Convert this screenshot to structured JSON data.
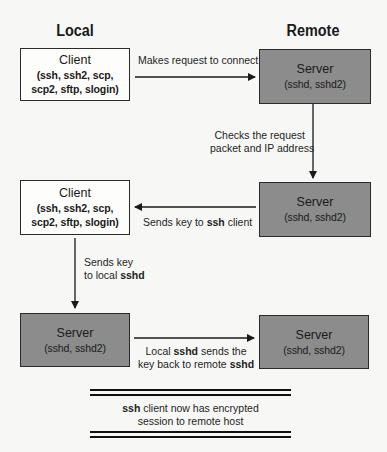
{
  "headings": {
    "local": "Local",
    "remote": "Remote"
  },
  "boxes": {
    "client_1": {
      "title": "Client",
      "line1": "(ssh, ssh2, scp,",
      "line2": "scp2, sftp, slogin)"
    },
    "server_1": {
      "title": "Server",
      "line1": "(sshd, sshd2)"
    },
    "client_2": {
      "title": "Client",
      "line1": "(ssh, ssh2, scp,",
      "line2": "scp2, sftp, slogin)"
    },
    "server_2": {
      "title": "Server",
      "line1": "(sshd, sshd2)"
    },
    "server_3": {
      "title": "Server",
      "line1": "(sshd, sshd2)"
    },
    "server_4": {
      "title": "Server",
      "line1": "(sshd, sshd2)"
    }
  },
  "steps": {
    "request": {
      "text": "Makes request to connect"
    },
    "check": {
      "line1": "Checks the request",
      "line2": "packet and IP address"
    },
    "send_key": {
      "pre": "Sends key to ",
      "bold": "ssh",
      "post": " client"
    },
    "local_sshd": {
      "line1": "Sends key",
      "line2_pre": "to local ",
      "line2_bold": "sshd"
    },
    "send_back": {
      "line1_pre": "Local ",
      "line1_bold": "sshd",
      "line1_post": " sends the",
      "line2_pre": "key back to remote ",
      "line2_bold": "sshd"
    }
  },
  "result": {
    "bold": "ssh",
    "line1_post": " client now has encrypted",
    "line2": "session to remote host"
  },
  "colors": {
    "server_fill": "#8c8c8c",
    "client_fill": "#fdfdfc",
    "stroke": "#1a1a1a"
  }
}
